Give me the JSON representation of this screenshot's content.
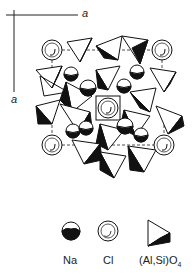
{
  "axes": {
    "horizontal_label": "a",
    "vertical_label": "a"
  },
  "legend": [
    {
      "symbol": "Na-sphere-icon",
      "label": "Na"
    },
    {
      "symbol": "Cl-sphere-icon",
      "label": "Cl"
    },
    {
      "symbol": "tetrahedron-icon",
      "label": "(Al,Si)O",
      "subscript": "4"
    }
  ],
  "atoms": {
    "cl": [
      [
        52,
        50
      ],
      [
        162,
        50
      ],
      [
        52,
        145
      ],
      [
        164,
        145
      ],
      [
        108,
        108
      ]
    ],
    "na": [
      [
        71,
        74
      ],
      [
        88,
        88
      ],
      [
        124,
        86
      ],
      [
        137,
        72
      ],
      [
        73,
        131
      ],
      [
        86,
        128
      ],
      [
        125,
        126
      ],
      [
        141,
        135
      ],
      [
        88,
        150
      ],
      [
        120,
        157
      ]
    ]
  },
  "colors": {
    "ink": "#111111",
    "paper": "#ffffff"
  }
}
